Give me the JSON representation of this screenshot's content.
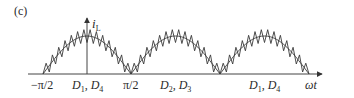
{
  "figure": {
    "panel_label": "(c)",
    "y_axis": {
      "symbol": "i",
      "subscript": "L"
    },
    "x_axis": {
      "label": "ωt"
    },
    "ticks": [
      {
        "label": "−π/2",
        "x": 43
      },
      {
        "label": "π/2",
        "x": 131
      }
    ],
    "regions": [
      {
        "d1": "D",
        "d1_sub": "1",
        "sep": ", ",
        "d2": "D",
        "d2_sub": "4",
        "x": 87
      },
      {
        "d1": "D",
        "d1_sub": "2",
        "sep": ", ",
        "d2": "D",
        "d2_sub": "3",
        "x": 176
      },
      {
        "d1": "D",
        "d1_sub": "1",
        "sep": ", ",
        "d2": "D",
        "d2_sub": "4",
        "x": 265
      }
    ]
  },
  "colors": {
    "line": "#3a3a3a",
    "axis": "#444444",
    "background": "#ffffff"
  }
}
